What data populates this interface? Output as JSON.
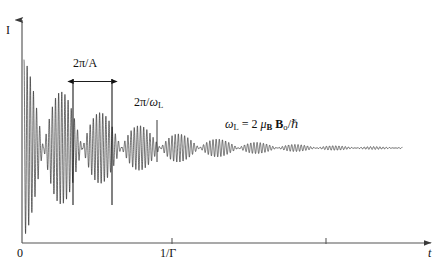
{
  "figure": {
    "type": "quantum-beat-decay-plot",
    "background_color": "#ffffff",
    "trace_color": "#1a1a1a",
    "axis_color": "#555555"
  },
  "axes": {
    "y_label": "I",
    "x_label": "t",
    "origin_px": [
      22,
      243
    ],
    "x_axis_end_px": [
      435,
      243
    ],
    "y_axis_top_px": [
      22,
      16
    ],
    "ticks": [
      {
        "label": "0",
        "x_px": 22,
        "labeled": true
      },
      {
        "label": "1/Γ",
        "x_px": 172,
        "labeled": true
      },
      {
        "label": "",
        "x_px": 326,
        "labeled": false
      }
    ]
  },
  "annotations": {
    "beat_period": {
      "label_prefix": "2π/",
      "label_symbol": "A",
      "label_full": "2π/A",
      "bracket_x_start_px": 73,
      "bracket_x_end_px": 112,
      "bracket_top_px": 79,
      "bracket_bottom_px": 205
    },
    "larmor_period": {
      "label_prefix": "2π/",
      "label_symbol": "ω",
      "label_subscript": "L",
      "label_full": "2π/ωL",
      "pointer_x_px": 157,
      "pointer_top_px": 120,
      "pointer_bottom_px": 162
    },
    "equation": {
      "lhs_symbol": "ω",
      "lhs_subscript": "L",
      "equals": "=",
      "factor": "2",
      "mu_symbol": "μ",
      "mu_subscript": "B",
      "field_symbol": "B",
      "field_subscript": "o",
      "divider": "/",
      "hbar": "ℏ",
      "full_text": "ωL = 2 μB Bo/ℏ"
    }
  },
  "chart_data": {
    "type": "line",
    "title": "",
    "xlabel": "t",
    "ylabel": "I",
    "grid": false,
    "legend": null,
    "model": {
      "formula": "I(t) = I0 * exp(-Gamma*t) * |cos(A*t/2)| * cos(omega_L*t)",
      "I0": 1.0,
      "gamma_rate_per_px": 0.0118,
      "beat_period_px": 39.0,
      "larmor_period_px": 3.15,
      "baseline_y_px": 148,
      "max_amplitude_px": 88,
      "trace_x_start_px": 24,
      "trace_x_end_px": 402,
      "samples": 7600
    },
    "axis_ranges": {
      "x_px": [
        22,
        435
      ],
      "y_px": [
        16,
        243
      ]
    },
    "beat_packet_centers_px": [
      24,
      63,
      102,
      141,
      180,
      219,
      258,
      297,
      336,
      375
    ],
    "beat_node_positions_px": [
      44,
      83,
      122,
      161,
      200,
      239,
      278,
      317,
      356,
      395
    ],
    "envelope_samples": [
      {
        "x_px": 24,
        "amplitude_px": 88
      },
      {
        "x_px": 63,
        "amplitude_px": 55
      },
      {
        "x_px": 102,
        "amplitude_px": 35
      },
      {
        "x_px": 141,
        "amplitude_px": 22
      },
      {
        "x_px": 180,
        "amplitude_px": 14
      },
      {
        "x_px": 219,
        "amplitude_px": 8.7
      },
      {
        "x_px": 258,
        "amplitude_px": 5.5
      },
      {
        "x_px": 297,
        "amplitude_px": 3.5
      },
      {
        "x_px": 336,
        "amplitude_px": 2.2
      },
      {
        "x_px": 375,
        "amplitude_px": 1.4
      }
    ]
  }
}
